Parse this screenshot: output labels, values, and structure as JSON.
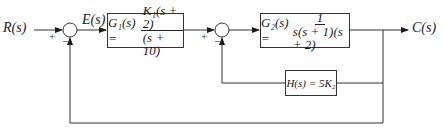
{
  "input": {
    "label": "R(s)"
  },
  "error": {
    "label": "E(s)"
  },
  "output": {
    "label": "C(s)"
  },
  "summer1": {
    "sign_top": "+",
    "sign_bottom": "−"
  },
  "summer2": {
    "sign_top": "+",
    "sign_bottom": "−"
  },
  "g1": {
    "lhs": "G₁(s) =",
    "numerator": "K₁(s + 2)",
    "denominator": "(s + 10)"
  },
  "g2": {
    "lhs": "G₂(s) =",
    "numerator": "1",
    "denominator": "s(s + 1)(s + 2)"
  },
  "h": {
    "expr": "H(s) = 5K₂"
  }
}
